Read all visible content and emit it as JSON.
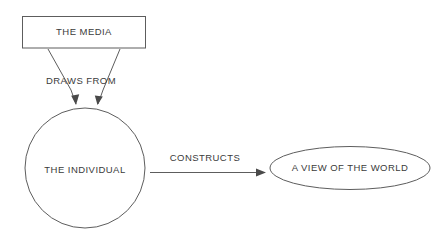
{
  "diagram": {
    "colors": {
      "stroke": "#5d5d5d",
      "arrow": "#4a4a4a",
      "text": "#3b3b3b",
      "background": "#ffffff"
    },
    "nodes": {
      "media": {
        "label": "THE MEDIA",
        "shape": "rectangle"
      },
      "individual": {
        "label": "THE INDIVIDUAL",
        "shape": "circle"
      },
      "worldview": {
        "label": "A VIEW OF THE WORLD",
        "shape": "ellipse"
      }
    },
    "edges": {
      "draws_from": {
        "label": "DRAWS FROM",
        "from": "individual",
        "to": "media"
      },
      "constructs": {
        "label": "CONSTRUCTS",
        "from": "individual",
        "to": "worldview"
      }
    }
  }
}
